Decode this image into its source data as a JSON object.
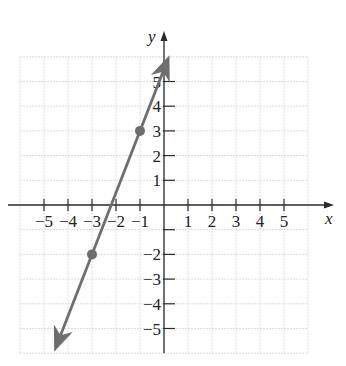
{
  "chart_data": {
    "type": "line",
    "title": "",
    "xlabel": "x",
    "ylabel": "y",
    "xlim": [
      -6,
      6
    ],
    "ylim": [
      -6,
      6
    ],
    "grid": true,
    "x_ticks": [
      -5,
      -4,
      -3,
      -2,
      -1,
      1,
      2,
      3,
      4,
      5
    ],
    "y_ticks": [
      -5,
      -4,
      -3,
      -2,
      -1,
      1,
      2,
      3,
      4,
      5
    ],
    "x_tick_labels": [
      "−5",
      "−4",
      "−3",
      "−2",
      "−1",
      "1",
      "2",
      "3",
      "4",
      "5"
    ],
    "y_tick_labels": [
      "−5",
      "−4",
      "−3",
      "−2",
      "",
      "1",
      "2",
      "3",
      "4",
      "5"
    ],
    "series": [
      {
        "name": "line",
        "equation": "y = 2.5x + 5.5",
        "slope": 2.5,
        "intercept": 5.5,
        "x": [
          -4.5,
          0.15
        ],
        "y": [
          -5.75,
          5.875
        ],
        "arrows": "both"
      }
    ],
    "points": [
      {
        "x": -3,
        "y": -2
      },
      {
        "x": -1,
        "y": 3
      }
    ],
    "colors": {
      "line": "#6e6e6e",
      "points": "#6e6e6e",
      "axes": "#2a2a2a",
      "grid": "#dcdcdc"
    }
  }
}
